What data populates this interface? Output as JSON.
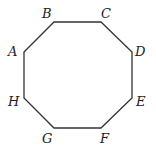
{
  "diagram": {
    "shape": "regular-octagon",
    "stroke_color": "#333333",
    "vertices": [
      {
        "label": "A",
        "x": 24,
        "y": 52,
        "lx": 8,
        "ly": 56
      },
      {
        "label": "B",
        "x": 54,
        "y": 22,
        "lx": 42,
        "ly": 18
      },
      {
        "label": "C",
        "x": 101,
        "y": 22,
        "lx": 101,
        "ly": 18
      },
      {
        "label": "D",
        "x": 132,
        "y": 52,
        "lx": 135,
        "ly": 56
      },
      {
        "label": "E",
        "x": 132,
        "y": 98,
        "lx": 136,
        "ly": 106
      },
      {
        "label": "F",
        "x": 101,
        "y": 128,
        "lx": 100,
        "ly": 143
      },
      {
        "label": "G",
        "x": 54,
        "y": 128,
        "lx": 42,
        "ly": 143
      },
      {
        "label": "H",
        "x": 24,
        "y": 98,
        "lx": 8,
        "ly": 106
      }
    ]
  }
}
